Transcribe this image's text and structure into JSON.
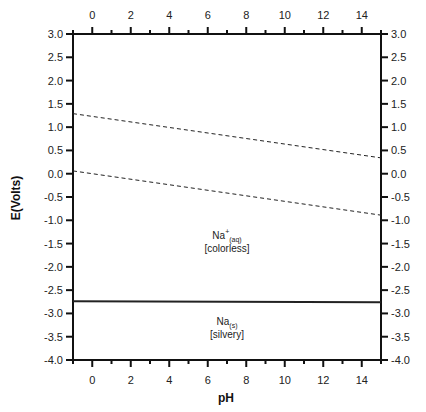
{
  "chart_data": {
    "type": "line",
    "title": "",
    "xlabel": "pH",
    "ylabel": "E(Volts)",
    "xlim": [
      -1,
      15
    ],
    "ylim": [
      -4.0,
      3.0
    ],
    "grid": false,
    "legend": null,
    "x_ticks": [
      0,
      2,
      4,
      6,
      8,
      10,
      12,
      14
    ],
    "x_tick_labels": [
      "0",
      "2",
      "4",
      "6",
      "8",
      "10",
      "12",
      "14"
    ],
    "y_ticks": [
      3.0,
      2.5,
      2.0,
      1.5,
      1.0,
      0.5,
      0.0,
      -0.5,
      -1.0,
      -1.5,
      -2.0,
      -2.5,
      -3.0,
      -3.5,
      -4.0
    ],
    "y_tick_labels": [
      "3.0",
      "2.5",
      "2.0",
      "1.5",
      "1.0",
      "0.5",
      "0.0",
      "-0.5",
      "-1.0",
      "-1.5",
      "-2.0",
      "-2.5",
      "-3.0",
      "-3.5",
      "-4.0"
    ],
    "mirror_axes": {
      "top": true,
      "right": true
    },
    "series": [
      {
        "name": "O2/H2O boundary",
        "style": "dashed",
        "x": [
          -1,
          15
        ],
        "y": [
          1.29,
          0.34
        ]
      },
      {
        "name": "H+/H2 boundary",
        "style": "dashed",
        "x": [
          -1,
          15
        ],
        "y": [
          0.06,
          -0.89
        ]
      },
      {
        "name": "Na+/Na boundary",
        "style": "solid",
        "x": [
          -1,
          15
        ],
        "y": [
          -2.74,
          -2.76
        ]
      }
    ],
    "annotations": [
      {
        "text": "Na+(aq)",
        "main": "Na",
        "sup": "+",
        "sub": "(aq)",
        "line2": "[colorless]",
        "x": 7.0,
        "y": -1.4
      },
      {
        "text": "Na(s)",
        "main": "Na",
        "sup": "",
        "sub": "(s)",
        "line2": "[silvery]",
        "x": 7.0,
        "y": -3.25
      }
    ]
  }
}
